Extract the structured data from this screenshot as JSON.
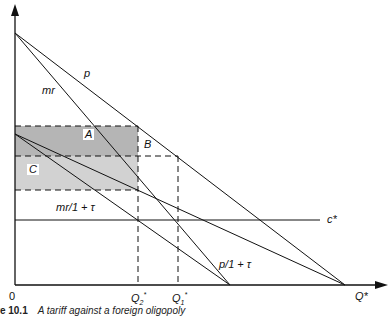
{
  "diagram": {
    "labels": {
      "p": "p",
      "mr": "mr",
      "A": "A",
      "B": "B",
      "C": "C",
      "mr_tau": "mr/1 + τ",
      "p_tau": "p/1 + τ",
      "c_star": "c*",
      "origin": "0",
      "q2": "Q",
      "q2_sub": "2",
      "q2_sup": "*",
      "q1": "Q",
      "q1_sub": "1",
      "q1_sup": "*",
      "x_axis": "Q*"
    },
    "caption": {
      "number": "re 10.1",
      "text": "A tariff against a foreign oligopoly"
    },
    "colors": {
      "line": "#111111",
      "shade_dark": "#b8b8b8",
      "shade_light": "#d4d4d4"
    }
  }
}
